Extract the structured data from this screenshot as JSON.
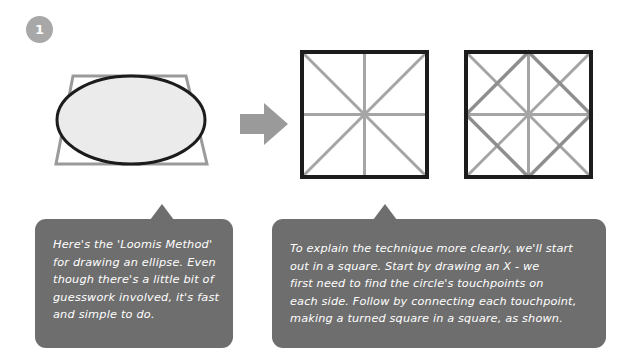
{
  "step": {
    "number": "1"
  },
  "figures": {
    "ellipse_in_trapezoid": {
      "icon": "ellipse-in-perspective-square",
      "outline_color": "#1c1c1c",
      "fill_color": "#ebebeb",
      "guide_color": "#9a9a9a"
    },
    "arrow": {
      "icon": "right-arrow-icon",
      "color": "#9a9a9a"
    },
    "square_with_x": {
      "icon": "square-with-x-and-center-lines",
      "border_color": "#1c1c1c",
      "guide_color": "#a5a5a5"
    },
    "square_with_turned_square": {
      "icon": "square-with-turned-square",
      "border_color": "#1c1c1c",
      "guide_color": "#a5a5a5"
    }
  },
  "bubbles": {
    "loomis": {
      "text": "Here's the 'Loomis Method'\nfor drawing an ellipse. Even\nthough there's a little bit of\nguesswork involved, it's fast\nand simple to do."
    },
    "square": {
      "text": "To explain the technique more clearly, we'll start\nout in a square. Start by drawing an X - we\nfirst need to find the circle's touchpoints on\neach side. Follow by connecting each touchpoint,\nmaking a turned square in a square, as shown."
    }
  },
  "colors": {
    "background": "#ffffff",
    "bubble": "#6e6e6e",
    "bubble_text": "#ffffff",
    "badge": "#a8a8a8",
    "ink": "#1c1c1c",
    "guide": "#a5a5a5"
  }
}
